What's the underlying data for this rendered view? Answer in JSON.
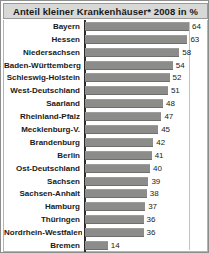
{
  "title": "Anteil kleiner Krankenhäuser* 2008 in %",
  "chart_data": {
    "type": "bar",
    "orientation": "horizontal",
    "title": "Anteil kleiner Krankenhäuser* 2008 in %",
    "xlabel": "",
    "ylabel": "",
    "xlim": [
      0,
      64
    ],
    "grid": false,
    "legend": null,
    "value_suffix": "",
    "categories": [
      "Bayern",
      "Hessen",
      "Niedersachsen",
      "Baden-Württemberg",
      "Schleswig-Holstein",
      "West-Deutschland",
      "Saarland",
      "Rheinland-Pfalz",
      "Mecklenburg-V.",
      "Brandenburg",
      "Berlin",
      "Ost-Deutschland",
      "Sachsen",
      "Sachsen-Anhalt",
      "Hamburg",
      "Thüringen",
      "Nordrhein-Westfalen",
      "Bremen"
    ],
    "values": [
      64,
      63,
      58,
      54,
      52,
      51,
      48,
      47,
      45,
      42,
      41,
      40,
      39,
      38,
      37,
      36,
      36,
      14
    ]
  },
  "colors": {
    "bar": "#8c8c8a",
    "title_background": "#d8d8d6",
    "axis": "#2b2b2b",
    "text": "#1a1a1a",
    "frame_border": "#8d8d8d"
  }
}
